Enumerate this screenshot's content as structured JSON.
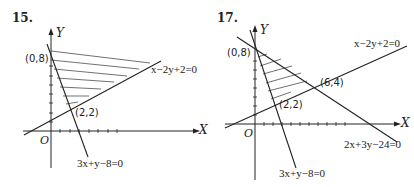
{
  "figures": [
    {
      "number": "15.",
      "axes": {
        "x_label": "X",
        "y_label": "Y",
        "origin_label": "O"
      },
      "points": [
        {
          "label": "(0,8)"
        },
        {
          "label": "(2,2)"
        }
      ],
      "lines": [
        {
          "equation": "x−2y+2=0"
        },
        {
          "equation": "3x+y−8=0"
        }
      ],
      "shaded_region": "Region above x−2y+2=0 and right of 3x+y−8=0 (unbounded)"
    },
    {
      "number": "17.",
      "axes": {
        "x_label": "X",
        "y_label": "Y",
        "origin_label": "O"
      },
      "points": [
        {
          "label": "(0,8)"
        },
        {
          "label": "(6,4)"
        },
        {
          "label": "(2,2)"
        }
      ],
      "lines": [
        {
          "equation": "x−2y+2=0"
        },
        {
          "equation": "2x+3y−24=0"
        },
        {
          "equation": "3x+y−8=0"
        }
      ],
      "shaded_region": "Triangle with vertices (0,8), (6,4), (2,2)"
    }
  ],
  "colors": {
    "ink": "#222222",
    "background": "#ffffff"
  }
}
